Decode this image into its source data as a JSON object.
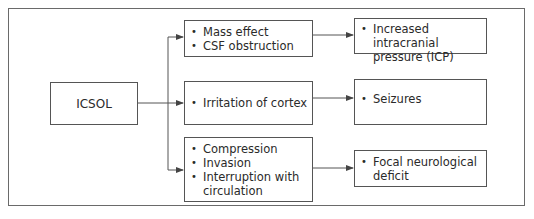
{
  "diagram": {
    "type": "flowchart",
    "root": {
      "label": "ICSOL"
    },
    "mechanisms": [
      {
        "items": [
          "Mass effect",
          "CSF obstruction"
        ]
      },
      {
        "items": [
          "Irritation of cortex"
        ]
      },
      {
        "items": [
          "Compression",
          "Invasion",
          "Interruption with circulation"
        ]
      }
    ],
    "outcomes": [
      {
        "items": [
          "Increased intracranial pressure (ICP)"
        ]
      },
      {
        "items": [
          "Seizures"
        ]
      },
      {
        "items": [
          "Focal neurological deficit"
        ]
      }
    ],
    "colors": {
      "line": "#555555",
      "text": "#2a2a2a",
      "background": "#ffffff"
    }
  }
}
